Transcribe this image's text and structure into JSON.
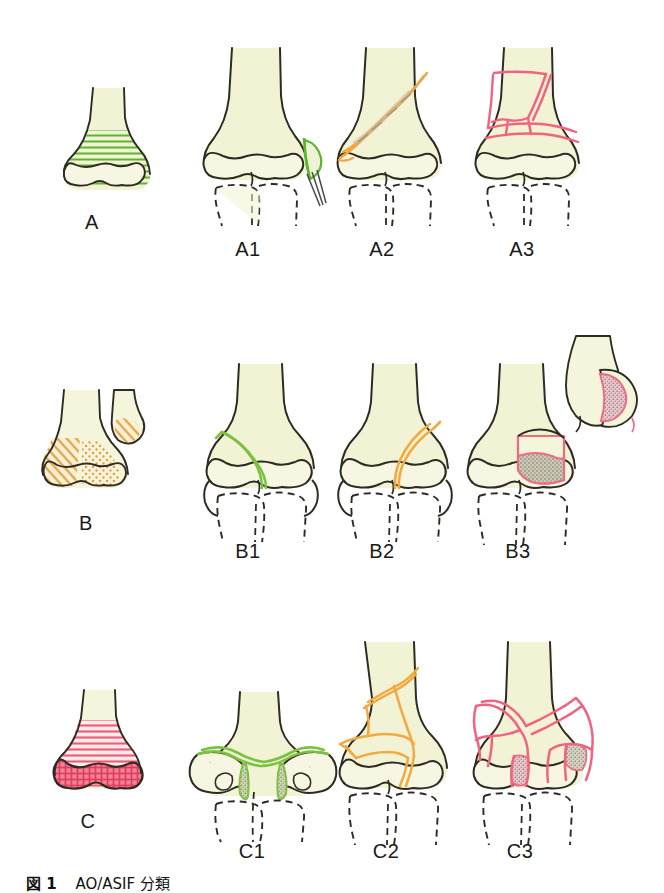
{
  "caption": {
    "figure_label": "図 1",
    "text": "AO/ASIF 分類"
  },
  "colors": {
    "bone_fill": "#f2f2d4",
    "bone_outline": "#2e2b22",
    "type_a_accent": "#5cb531",
    "type_b_accent": "#f0a63c",
    "type_c_accent": "#ef4f6b",
    "fragment_shade": "#a9a493",
    "background": "#ffffff"
  },
  "rows": [
    {
      "id": "row-a",
      "type_label": "A",
      "accent": "#5cb531",
      "items": [
        {
          "id": "a1",
          "label": "A1"
        },
        {
          "id": "a2",
          "label": "A2"
        },
        {
          "id": "a3",
          "label": "A3"
        }
      ]
    },
    {
      "id": "row-b",
      "type_label": "B",
      "accent": "#f0a63c",
      "items": [
        {
          "id": "b1",
          "label": "B1"
        },
        {
          "id": "b2",
          "label": "B2"
        },
        {
          "id": "b3",
          "label": "B3"
        }
      ]
    },
    {
      "id": "row-c",
      "type_label": "C",
      "accent": "#ef4f6b",
      "items": [
        {
          "id": "c1",
          "label": "C1"
        },
        {
          "id": "c2",
          "label": "C2"
        },
        {
          "id": "c3",
          "label": "C3"
        }
      ]
    }
  ]
}
